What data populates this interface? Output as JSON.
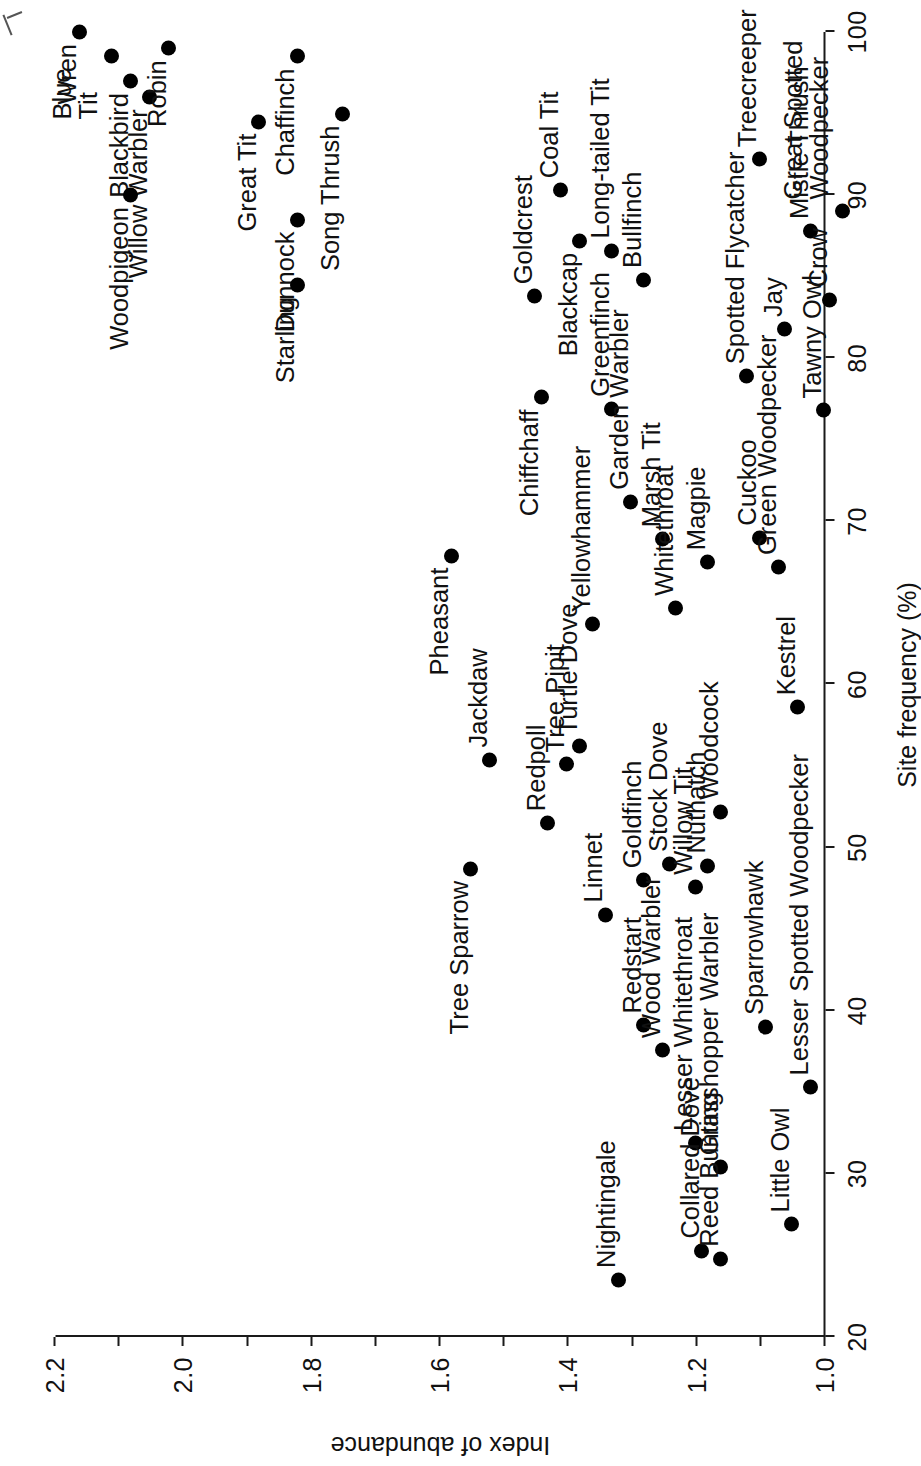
{
  "chart_data": {
    "type": "scatter",
    "title": "",
    "xlabel": "Site frequency (%)",
    "ylabel": "Index of abundance",
    "xlim": [
      20,
      100
    ],
    "ylim": [
      1.0,
      2.2
    ],
    "xticks": [
      20,
      30,
      40,
      50,
      60,
      70,
      80,
      90,
      100
    ],
    "xticklabels": [
      "20",
      "30",
      "40",
      "50",
      "60",
      "70",
      "80",
      "90",
      "100"
    ],
    "yticks": [
      1.0,
      1.1,
      1.2,
      1.3,
      1.4,
      1.5,
      1.6,
      1.7,
      1.8,
      1.9,
      2.0,
      2.1,
      2.2
    ],
    "yticklabels": [
      "1.0",
      "",
      "1.2",
      "",
      "1.4",
      "",
      "1.6",
      "",
      "1.8",
      "",
      "2.0",
      "",
      "2.2"
    ],
    "grid": false,
    "legend": "none",
    "marker": "filled-circle",
    "marker_color": "#000000",
    "points": [
      {
        "label": "Wren",
        "x": 100.0,
        "y": 2.14,
        "lpos": "left",
        "lines": [
          "Wren"
        ]
      },
      {
        "label": "Blue Tit",
        "x": 98.5,
        "y": 2.09,
        "lpos": "left",
        "lines": [
          "Blue",
          "Tit"
        ]
      },
      {
        "label": "Blackbird",
        "x": 97.0,
        "y": 2.06,
        "lpos": "left",
        "lines": [
          "Blackbird"
        ]
      },
      {
        "label": "Willow Warbler",
        "x": 96.0,
        "y": 2.03,
        "lpos": "left",
        "lines": [
          "Willow Warbler"
        ]
      },
      {
        "label": "Robin",
        "x": 99.0,
        "y": 2.0,
        "lpos": "left",
        "lines": [
          "Robin"
        ]
      },
      {
        "label": "Woodpigeon",
        "x": 90.0,
        "y": 2.06,
        "lpos": "left",
        "lines": [
          "Woodpigeon"
        ]
      },
      {
        "label": "Great Tit",
        "x": 94.5,
        "y": 1.86,
        "lpos": "left",
        "lines": [
          "Great Tit"
        ]
      },
      {
        "label": "Chaffinch",
        "x": 98.5,
        "y": 1.8,
        "lpos": "left",
        "lines": [
          "Chaffinch"
        ]
      },
      {
        "label": "Song Thrush",
        "x": 95.0,
        "y": 1.73,
        "lpos": "left",
        "lines": [
          "Song Thrush"
        ]
      },
      {
        "label": "Dunnock",
        "x": 88.5,
        "y": 1.8,
        "lpos": "left",
        "lines": [
          "Dunnock"
        ]
      },
      {
        "label": "Starling",
        "x": 84.5,
        "y": 1.8,
        "lpos": "left",
        "lines": [
          "Starling"
        ]
      },
      {
        "label": "Goldcrest",
        "x": 83.8,
        "y": 1.43,
        "lpos": "right",
        "lines": [
          "Goldcrest"
        ]
      },
      {
        "label": "Blackcap",
        "x": 87.2,
        "y": 1.36,
        "lpos": "left",
        "lines": [
          "Blackcap"
        ]
      },
      {
        "label": "Chiffchaff",
        "x": 77.6,
        "y": 1.42,
        "lpos": "left",
        "lines": [
          "Chiffchaff"
        ]
      },
      {
        "label": "Coal Tit",
        "x": 90.3,
        "y": 1.39,
        "lpos": "right",
        "lines": [
          "Coal Tit"
        ]
      },
      {
        "label": "Long-tailed Tit",
        "x": 86.6,
        "y": 1.31,
        "lpos": "right",
        "lines": [
          "Long-tailed Tit"
        ]
      },
      {
        "label": "Bullfinch",
        "x": 84.8,
        "y": 1.26,
        "lpos": "right",
        "lines": [
          "Bullfinch"
        ]
      },
      {
        "label": "Treecreeper",
        "x": 92.2,
        "y": 1.08,
        "lpos": "right",
        "lines": [
          "Treecreeper"
        ]
      },
      {
        "label": "Mistle Thrush",
        "x": 87.8,
        "y": 1.0,
        "lpos": "right",
        "lines": [
          "Mistle Thrush"
        ]
      },
      {
        "label": "Spotted Flycatcher",
        "x": 78.9,
        "y": 1.1,
        "lpos": "right",
        "lines": [
          "Spotted Flycatcher"
        ]
      },
      {
        "label": "Jay",
        "x": 81.8,
        "y": 1.04,
        "lpos": "right",
        "lines": [
          "Jay"
        ]
      },
      {
        "label": "Crow",
        "x": 83.6,
        "y": 0.97,
        "lpos": "right",
        "lines": [
          "Crow"
        ]
      },
      {
        "label": "Great Spotted Woodpecker",
        "x": 89.0,
        "y": 0.95,
        "lpos": "right",
        "lines": [
          "Great Spotted",
          "Woodpecker"
        ]
      },
      {
        "label": "Tawny Owl",
        "x": 76.8,
        "y": 0.98,
        "lpos": "right",
        "lines": [
          "Tawny Owl"
        ]
      },
      {
        "label": "Greenfinch",
        "x": 76.9,
        "y": 1.31,
        "lpos": "right",
        "lines": [
          "Greenfinch"
        ]
      },
      {
        "label": "Garden Warbler",
        "x": 71.2,
        "y": 1.28,
        "lpos": "right",
        "lines": [
          "Garden Warbler"
        ]
      },
      {
        "label": "Marsh Tit",
        "x": 68.9,
        "y": 1.23,
        "lpos": "right",
        "lines": [
          "Marsh Tit"
        ]
      },
      {
        "label": "Pheasant",
        "x": 67.9,
        "y": 1.56,
        "lpos": "left",
        "lines": [
          "Pheasant"
        ]
      },
      {
        "label": "Whitethroat",
        "x": 64.7,
        "y": 1.21,
        "lpos": "right",
        "lines": [
          "Whitethroat"
        ]
      },
      {
        "label": "Yellowhammer",
        "x": 63.7,
        "y": 1.34,
        "lpos": "right",
        "lines": [
          "Yellowhammer"
        ]
      },
      {
        "label": "Magpie",
        "x": 67.5,
        "y": 1.16,
        "lpos": "right",
        "lines": [
          "Magpie"
        ]
      },
      {
        "label": "Cuckoo",
        "x": 69.0,
        "y": 1.08,
        "lpos": "right",
        "lines": [
          "Cuckoo"
        ]
      },
      {
        "label": "Green Woodpecker",
        "x": 67.2,
        "y": 1.05,
        "lpos": "right",
        "lines": [
          "Green Woodpecker"
        ]
      },
      {
        "label": "Kestrel",
        "x": 58.6,
        "y": 1.02,
        "lpos": "right",
        "lines": [
          "Kestrel"
        ]
      },
      {
        "label": "Jackdaw",
        "x": 55.4,
        "y": 1.5,
        "lpos": "right",
        "lines": [
          "Jackdaw"
        ]
      },
      {
        "label": "Tree Pipit",
        "x": 55.1,
        "y": 1.38,
        "lpos": "right",
        "lines": [
          "Tree Pipit"
        ]
      },
      {
        "label": "Turtle Dove",
        "x": 56.2,
        "y": 1.36,
        "lpos": "right",
        "lines": [
          "Turtle Dove"
        ]
      },
      {
        "label": "Tree Sparrow",
        "x": 48.7,
        "y": 1.53,
        "lpos": "left",
        "lines": [
          "Tree Sparrow"
        ]
      },
      {
        "label": "Redpoll",
        "x": 51.5,
        "y": 1.41,
        "lpos": "right",
        "lines": [
          "Redpoll"
        ]
      },
      {
        "label": "Goldfinch",
        "x": 48.0,
        "y": 1.26,
        "lpos": "right",
        "lines": [
          "Goldfinch"
        ]
      },
      {
        "label": "Stock Dove",
        "x": 49.0,
        "y": 1.22,
        "lpos": "right",
        "lines": [
          "Stock Dove"
        ]
      },
      {
        "label": "Linnet",
        "x": 45.9,
        "y": 1.32,
        "lpos": "right",
        "lines": [
          "Linnet"
        ]
      },
      {
        "label": "Willow Tit",
        "x": 47.6,
        "y": 1.18,
        "lpos": "right",
        "lines": [
          "Willow Tit"
        ]
      },
      {
        "label": "Nuthatch",
        "x": 48.9,
        "y": 1.16,
        "lpos": "right",
        "lines": [
          "Nuthatch"
        ]
      },
      {
        "label": "Woodcock",
        "x": 52.2,
        "y": 1.14,
        "lpos": "right",
        "lines": [
          "Woodcock"
        ]
      },
      {
        "label": "Redstart",
        "x": 39.1,
        "y": 1.26,
        "lpos": "right",
        "lines": [
          "Redstart"
        ]
      },
      {
        "label": "Wood Warbler",
        "x": 37.6,
        "y": 1.23,
        "lpos": "right",
        "lines": [
          "Wood Warbler"
        ]
      },
      {
        "label": "Lesser Whitethroat",
        "x": 31.9,
        "y": 1.18,
        "lpos": "right",
        "lines": [
          "Lesser Whitethroat"
        ]
      },
      {
        "label": "Grasshopper Warbler",
        "x": 30.4,
        "y": 1.14,
        "lpos": "right",
        "lines": [
          "Grasshopper Warbler"
        ]
      },
      {
        "label": "Sparrowhawk",
        "x": 39.0,
        "y": 1.07,
        "lpos": "right",
        "lines": [
          "Sparrowhawk"
        ]
      },
      {
        "label": "Lesser Spotted Woodpecker",
        "x": 35.3,
        "y": 1.0,
        "lpos": "right",
        "lines": [
          "Lesser Spotted Woodpecker"
        ]
      },
      {
        "label": "Nightingale",
        "x": 23.5,
        "y": 1.3,
        "lpos": "right",
        "lines": [
          "Nightingale"
        ]
      },
      {
        "label": "Collared Dove",
        "x": 25.3,
        "y": 1.17,
        "lpos": "right",
        "lines": [
          "Collared Dove"
        ]
      },
      {
        "label": "Reed Bunting",
        "x": 24.8,
        "y": 1.14,
        "lpos": "right",
        "lines": [
          "Reed Bunting"
        ]
      },
      {
        "label": "Little Owl",
        "x": 26.9,
        "y": 1.03,
        "lpos": "right",
        "lines": [
          "Little Owl"
        ]
      }
    ]
  }
}
